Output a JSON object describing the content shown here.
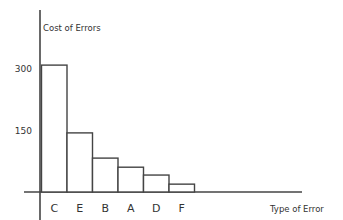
{
  "chart_data": {
    "type": "bar",
    "title": "",
    "xlabel": "Type of Error",
    "ylabel": "Cost of Errors",
    "categories": [
      "C",
      "E",
      "B",
      "A",
      "D",
      "F"
    ],
    "values": [
      307,
      143,
      82,
      60,
      41,
      19
    ],
    "yticks": [
      150,
      300
    ],
    "ytick_labels": [
      "150",
      "300"
    ],
    "ylim": [
      0,
      400
    ],
    "grid": false,
    "legend": null,
    "bar_fill": "#ffffff",
    "bar_stroke": "#444444",
    "axis_color": "#444444"
  }
}
